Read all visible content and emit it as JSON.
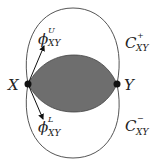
{
  "diagram": {
    "points": [
      {
        "label": "X",
        "x": 28,
        "y": 84
      },
      {
        "label": "Y",
        "x": 117,
        "y": 84
      }
    ],
    "curves": [
      {
        "name": "C",
        "sup": "+",
        "sub": "XY"
      },
      {
        "name": "C",
        "sup": "−",
        "sub": "XY"
      }
    ],
    "vectors": [
      {
        "name": "ϕ",
        "sup": "U",
        "sub": "XY"
      },
      {
        "name": "ϕ",
        "sup": "L",
        "sub": "XY"
      }
    ],
    "colors": {
      "lens_fill": "#6e6e6e",
      "stroke": "#555555",
      "point": "#111111"
    }
  }
}
